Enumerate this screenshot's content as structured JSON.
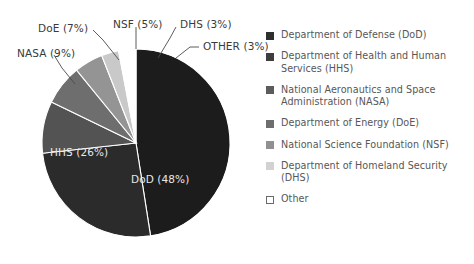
{
  "chart_data": {
    "type": "pie",
    "title": "",
    "subtitle": "",
    "xlabel": "",
    "ylabel": "",
    "legend_position": "right",
    "grid": false,
    "categories": [
      "Department of Defense (DoD)",
      "Department of Health and Human Services (HHS)",
      "National Aeronautics and Space Administration (NASA)",
      "Department of Energy (DoE)",
      "National Science Foundation (NSF)",
      "Department of Homeland Security (DHS)",
      "Other"
    ],
    "values": [
      48,
      26,
      9,
      7,
      5,
      3,
      3
    ],
    "unit": "%",
    "slices": [
      {
        "key": "dod",
        "abbr": "DoD",
        "value": 48,
        "label": "DoD (48%)",
        "color": "#1c1c1c",
        "label_kind": "inner"
      },
      {
        "key": "hhs",
        "abbr": "HHS",
        "value": 26,
        "label": "HHS (26%)",
        "color": "#2b2b2b",
        "label_kind": "inner"
      },
      {
        "key": "nasa",
        "abbr": "NASA",
        "value": 9,
        "label": "NASA (9%)",
        "color": "#535353",
        "label_kind": "callout"
      },
      {
        "key": "doe",
        "abbr": "DoE",
        "value": 7,
        "label": "DoE (7%)",
        "color": "#6e6e6e",
        "label_kind": "callout"
      },
      {
        "key": "nsf",
        "abbr": "NSF",
        "value": 5,
        "label": "NSF (5%)",
        "color": "#949494",
        "label_kind": "callout"
      },
      {
        "key": "dhs",
        "abbr": "DHS",
        "value": 3,
        "label": "DHS (3%)",
        "color": "#c9c9c9",
        "label_kind": "callout"
      },
      {
        "key": "other",
        "abbr": "OTHER",
        "value": 3,
        "label": "OTHER (3%)",
        "color": "#ffffff",
        "label_kind": "callout"
      }
    ]
  },
  "labels": {
    "dod": "DoD (48%)",
    "hhs": "HHS (26%)",
    "nasa": "NASA (9%)",
    "doe": "DoE (7%)",
    "nsf": "NSF (5%)",
    "dhs": "DHS (3%)",
    "other": "OTHER (3%)"
  },
  "legend": {
    "items": [
      {
        "label": "Department of Defense (DoD)",
        "color": "#2f2f2f"
      },
      {
        "label": "Department of Health and Human Services (HHS)",
        "color": "#3d3d3d"
      },
      {
        "label": "National Aeronautics and Space Administration (NASA)",
        "color": "#5c5c5c"
      },
      {
        "label": "Department of Energy (DoE)",
        "color": "#6e6e6e"
      },
      {
        "label": "National Science Foundation (NSF)",
        "color": "#909090"
      },
      {
        "label": "Department of Homeland Security (DHS)",
        "color": "#d2d2d2"
      },
      {
        "label": "Other",
        "color": "#ffffff"
      }
    ]
  },
  "colors": {
    "background": "#ffffff",
    "label_text": "#3a3a3a",
    "inner_label_text": "#e8e8e8",
    "legend_text": "#575757",
    "slice_outline": "#ffffff",
    "leader_line": "#4a4a4a"
  }
}
